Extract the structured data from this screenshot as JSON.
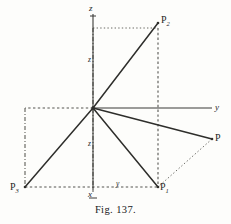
{
  "figure": {
    "caption": "Fig. 137.",
    "width": 231,
    "height": 224,
    "background_color": "#fdfdfb",
    "ink_color": "#2e2e2b"
  },
  "axes": [
    {
      "id": "z",
      "label": "z",
      "direction": "up",
      "tip": [
        93,
        14
      ]
    },
    {
      "id": "y",
      "label": "y",
      "direction": "right",
      "tip": [
        212,
        108
      ]
    },
    {
      "id": "x",
      "label": "x",
      "direction": "down",
      "tip": [
        93,
        190
      ]
    }
  ],
  "origin": {
    "label": "O",
    "x": 93,
    "y": 108
  },
  "points": [
    {
      "id": "P",
      "label": "P",
      "sub": "",
      "x": 212,
      "y": 139
    },
    {
      "id": "P1",
      "label": "P",
      "sub": "1",
      "x": 158,
      "y": 187
    },
    {
      "id": "P2",
      "label": "P",
      "sub": "2",
      "x": 158,
      "y": 23
    },
    {
      "id": "P3",
      "label": "P",
      "sub": "3",
      "x": 25,
      "y": 187
    }
  ],
  "segment_labels": [
    {
      "id": "z-upper",
      "text": "z",
      "x": 88,
      "y": 60
    },
    {
      "id": "z-lower",
      "text": "z",
      "x": 88,
      "y": 144
    },
    {
      "id": "y-base",
      "text": "y",
      "x": 117,
      "y": 183
    }
  ],
  "rays": [
    {
      "from": "origin",
      "to": "P2",
      "style": "solid"
    },
    {
      "from": "origin",
      "to": "P",
      "style": "solid"
    },
    {
      "from": "origin",
      "to": "P1",
      "style": "solid"
    },
    {
      "from": "origin",
      "to": "P3",
      "style": "solid"
    }
  ],
  "construction_lines": [
    {
      "id": "z-to-P2-horizontal",
      "style": "dotted",
      "from": [
        93,
        28
      ],
      "to": [
        158,
        28
      ]
    },
    {
      "id": "P2-to-P1-vertical",
      "style": "dashed",
      "from": [
        158,
        28
      ],
      "to": [
        158,
        187
      ]
    },
    {
      "id": "P-to-P1-diagonal",
      "style": "dotted",
      "from": [
        212,
        139
      ],
      "to": [
        158,
        187
      ]
    },
    {
      "id": "origin-left-edge",
      "style": "dashed",
      "from": [
        93,
        108
      ],
      "to": [
        25,
        108
      ]
    },
    {
      "id": "P3-vertical",
      "style": "dashdot",
      "from": [
        25,
        108
      ],
      "to": [
        25,
        187
      ]
    },
    {
      "id": "P3-to-P1-baseline",
      "style": "dashed",
      "from": [
        25,
        187
      ],
      "to": [
        158,
        187
      ]
    },
    {
      "id": "z-axis-dashed",
      "style": "dashdot",
      "from": [
        93,
        28
      ],
      "to": [
        93,
        190
      ]
    }
  ],
  "type": "geometric-diagram"
}
